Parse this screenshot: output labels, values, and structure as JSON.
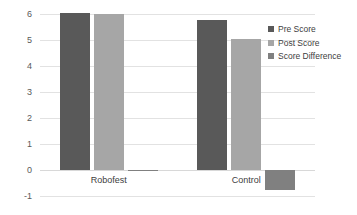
{
  "chart_data": {
    "type": "bar",
    "title": "",
    "subtitle": "",
    "xlabel": "",
    "ylabel": "",
    "categories": [
      "Robofest",
      "Control"
    ],
    "series": [
      {
        "name": "Pre Score",
        "color": "#595959",
        "values": [
          6.05,
          5.78
        ]
      },
      {
        "name": "Post Score",
        "color": "#a6a6a6",
        "values": [
          6.0,
          5.02
        ]
      },
      {
        "name": "Score Difference",
        "color": "#808080",
        "values": [
          -0.05,
          -0.78
        ]
      }
    ],
    "ylim": [
      -1,
      6
    ],
    "yticks": [
      "6",
      "5",
      "4",
      "3",
      "2",
      "1",
      "0",
      "-1"
    ],
    "ytick_values": [
      6,
      5,
      4,
      3,
      2,
      1,
      0,
      -1
    ],
    "grid": true,
    "grid_axis": "y",
    "legend_position": "right",
    "legend_entries": [
      "Pre Score",
      "Post Score",
      "Score Difference"
    ],
    "background_color": "#ffffff",
    "gridline_color": "#e2e2e2",
    "tick_label_color": "#595959"
  }
}
